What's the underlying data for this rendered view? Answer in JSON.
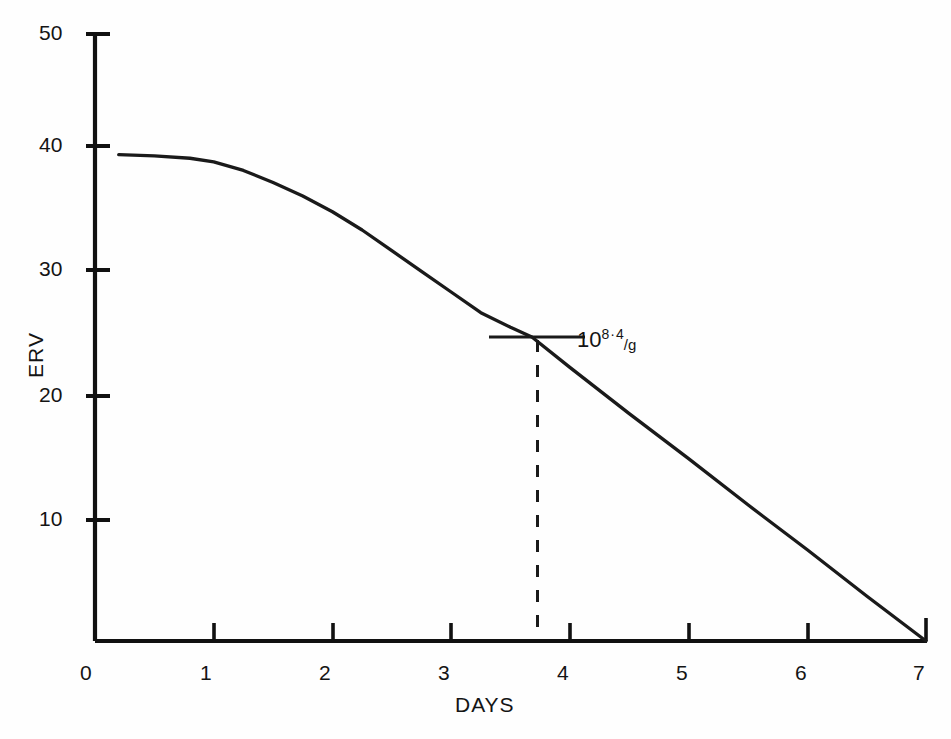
{
  "chart_data": {
    "type": "line",
    "title": "",
    "subtitle": "",
    "xlabel": "DAYS",
    "ylabel": "ERV",
    "xlim": [
      0,
      7
    ],
    "ylim": [
      0,
      50
    ],
    "xticks": [
      "0",
      "1",
      "2",
      "3",
      "4",
      "5",
      "6",
      "7"
    ],
    "xtick_values": [
      0,
      1,
      2,
      3,
      4,
      5,
      6,
      7
    ],
    "yticks": [
      "10",
      "20",
      "30",
      "40",
      "50"
    ],
    "ytick_values": [
      10,
      20,
      30,
      40,
      50
    ],
    "grid": false,
    "legend": null,
    "series": [
      {
        "name": "ERV decay",
        "x": [
          0.2,
          0.5,
          0.8,
          1.0,
          1.25,
          1.5,
          1.75,
          2.0,
          2.25,
          2.5,
          2.75,
          3.0,
          3.25,
          3.5,
          3.68,
          4.0,
          4.5,
          5.0,
          5.5,
          6.0,
          6.5,
          7.0
        ],
        "y": [
          40.0,
          39.9,
          39.7,
          39.4,
          38.7,
          37.7,
          36.6,
          35.3,
          33.8,
          32.1,
          30.4,
          28.7,
          27.0,
          25.8,
          25.0,
          22.5,
          18.7,
          15.0,
          11.2,
          7.5,
          3.7,
          0.0
        ]
      }
    ],
    "annotations": [
      {
        "name": "exponent-callout",
        "text": "10^8.4/g",
        "base": "10",
        "exponent": "8",
        "exponent_separator": "·",
        "exponent_decimal": "4",
        "denominator": "/g",
        "marker_x": 3.68,
        "marker_y": 25.0,
        "marker_type": "horizontal-tick-with-dashed-dropline",
        "dashed_dropline_to_y": 0
      }
    ],
    "axis_color": "#111111",
    "curve_color": "#1a1a1a",
    "background_color": "#fefefe"
  },
  "axis": {
    "y_tick_labels": [
      "50",
      "40",
      "30",
      "20",
      "10"
    ],
    "x_tick_labels": [
      "0",
      "1",
      "2",
      "3",
      "4",
      "5",
      "6",
      "7"
    ],
    "y_axis_title": "ERV",
    "x_axis_title": "DAYS"
  },
  "callout": {
    "base": "10",
    "exponent": "8",
    "separator": "·",
    "decimal": "4",
    "unit": "/g"
  }
}
